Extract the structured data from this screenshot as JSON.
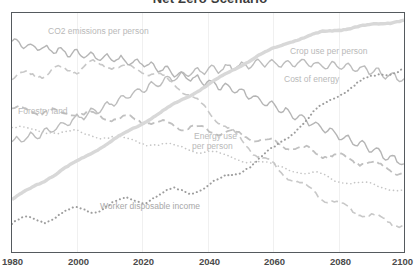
{
  "chart_data": {
    "type": "line",
    "title": "Net Zero Scenario",
    "xlabel": "",
    "ylabel": "",
    "xlim": [
      1980,
      2100
    ],
    "ylim": [
      0,
      100
    ],
    "grid": true,
    "legend_position": "inline-labels",
    "xticks": [
      1980,
      2000,
      2020,
      2040,
      2060,
      2080,
      2100
    ],
    "x": [
      1980,
      1985,
      1990,
      1995,
      2000,
      2005,
      2010,
      2015,
      2020,
      2025,
      2030,
      2035,
      2040,
      2045,
      2050,
      2055,
      2060,
      2065,
      2070,
      2075,
      2080,
      2085,
      2090,
      2095,
      2100
    ],
    "series": [
      {
        "name": "CO2 emissions per person",
        "label": "CO2 emissions per person",
        "style": "dashed",
        "color": "#c8c8c8",
        "width": 1.6,
        "values": [
          72,
          75,
          74,
          77,
          76,
          79,
          78,
          77,
          76,
          74,
          70,
          65,
          59,
          53,
          47,
          41,
          36,
          31,
          27,
          23,
          20,
          17,
          15,
          13,
          11
        ]
      },
      {
        "name": "Crop use per person",
        "label": "Crop use per person",
        "style": "solid-wavy",
        "color": "#bdbdbd",
        "width": 1.4,
        "values": [
          46,
          48,
          50,
          53,
          56,
          59,
          62,
          65,
          68,
          71,
          73,
          75,
          76,
          77,
          78,
          79,
          79,
          79,
          79,
          78,
          78,
          77,
          76,
          74,
          72
        ]
      },
      {
        "name": "Cost of energy",
        "label": "Cost of energy",
        "style": "solid-wavy",
        "color": "#b5b5b5",
        "width": 1.4,
        "values": [
          88,
          86,
          85,
          84,
          83,
          82,
          81,
          80,
          79,
          77,
          75,
          73,
          71,
          69,
          67,
          64,
          61,
          58,
          55,
          52,
          49,
          46,
          43,
          40,
          37
        ]
      },
      {
        "name": "Forestry land",
        "label": "Forestry land",
        "style": "dotted",
        "color": "#c5c5c5",
        "width": 1.6,
        "values": [
          52,
          51,
          51,
          50,
          50,
          49,
          48,
          47,
          46,
          45,
          44,
          43,
          42,
          40,
          39,
          38,
          36,
          35,
          33,
          32,
          30,
          29,
          28,
          27,
          26
        ]
      },
      {
        "name": "Energy use per person",
        "label": "Energy use per person",
        "style": "dashed",
        "color": "#c0c0c0",
        "width": 1.8,
        "values": [
          60,
          59,
          59,
          58,
          58,
          57,
          56,
          56,
          55,
          54,
          53,
          52,
          51,
          50,
          49,
          47,
          46,
          44,
          43,
          41,
          40,
          38,
          37,
          35,
          33
        ]
      },
      {
        "name": "Worker disposable income",
        "label": "Worker disposable income",
        "style": "dotted",
        "color": "#9d9d9d",
        "width": 2.0,
        "values": [
          12,
          14,
          13,
          16,
          18,
          17,
          20,
          22,
          21,
          24,
          26,
          25,
          28,
          31,
          34,
          38,
          43,
          49,
          55,
          61,
          66,
          70,
          73,
          75,
          77
        ]
      },
      {
        "name": "Population thick trend",
        "label": "",
        "style": "solid-thick",
        "color": "#d8d8d8",
        "width": 3.4,
        "values": [
          22,
          26,
          30,
          34,
          38,
          42,
          46,
          50,
          54,
          58,
          62,
          66,
          70,
          74,
          78,
          82,
          85,
          88,
          90,
          92,
          93,
          94,
          95,
          96,
          97
        ]
      }
    ]
  },
  "labels": {
    "co2": "CO2 emissions per person",
    "crop": "Crop use per person",
    "cost": "Cost of energy",
    "forestry": "Forestry land",
    "energy_line1": "Energy use",
    "energy_line2": "per person",
    "worker": "Worker disposable income"
  },
  "xticks": {
    "t1980": "1980",
    "t2000": "2000",
    "t2020": "2020",
    "t2040": "2040",
    "t2060": "2060",
    "t2080": "2080",
    "t2100": "2100"
  },
  "colors": {
    "frame": "#555a5e",
    "grid": "#f0f0f0",
    "label": "#b9b9b9",
    "tick": "#4a4a4a",
    "title": "#3c3c3c"
  }
}
